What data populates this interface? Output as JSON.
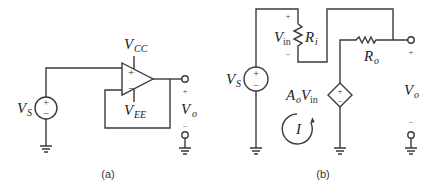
{
  "figure_a": {
    "caption": "(a)",
    "source_label": "V",
    "source_sub": "S",
    "vcc_label": "V",
    "vcc_sub": "CC",
    "vee_label": "V",
    "vee_sub": "EE",
    "out_label": "V",
    "out_sub": "o",
    "plus": "+",
    "minus": "−",
    "opamp_plus": "+",
    "opamp_minus": "−"
  },
  "figure_b": {
    "caption": "(b)",
    "source_label": "V",
    "source_sub": "S",
    "vin_label": "V",
    "vin_sub": "in",
    "ri_label": "R",
    "ri_sub": "i",
    "ro_label": "R",
    "ro_sub": "o",
    "dep_label_a": "A",
    "dep_label_a_sub": "o",
    "dep_label_v": "V",
    "dep_label_v_sub": "in",
    "current_label": "I",
    "out_label": "V",
    "out_sub": "o",
    "plus": "+",
    "minus": "−"
  }
}
